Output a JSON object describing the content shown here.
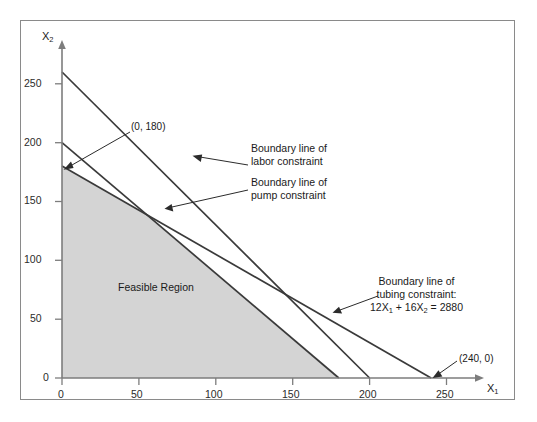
{
  "chart_data": {
    "type": "line",
    "title": "",
    "xlabel": "X1",
    "ylabel": "X2",
    "xlim": [
      0,
      270
    ],
    "ylim": [
      0,
      275
    ],
    "grid": false,
    "legend": "none",
    "xticks": [
      0,
      50,
      100,
      150,
      200,
      250
    ],
    "yticks": [
      0,
      50,
      100,
      150,
      200,
      250
    ],
    "xtick_labels": [
      "0",
      "50",
      "100",
      "150",
      "200",
      "250"
    ],
    "ytick_labels": [
      "0",
      "50",
      "100",
      "150",
      "200",
      "250"
    ],
    "series": [
      {
        "name": "Boundary line of tubing constraint",
        "equation": "12X1 + 16X2 = 2880",
        "x": [
          0,
          240
        ],
        "y": [
          180,
          0
        ],
        "intercepts": {
          "x": 240,
          "y": 180
        }
      },
      {
        "name": "Boundary line of labor constraint",
        "x": [
          0,
          200
        ],
        "y": [
          260,
          0
        ],
        "intercepts": {
          "x": 200,
          "y": 260
        }
      },
      {
        "name": "Boundary line of pump constraint",
        "x": [
          0,
          180
        ],
        "y": [
          200,
          0
        ],
        "intercepts": {
          "x": 180,
          "y": 200
        }
      }
    ],
    "shaded_region": {
      "name": "Feasible Region",
      "fill": "#d4d4d4",
      "vertices": [
        [
          0,
          0
        ],
        [
          0,
          180
        ],
        [
          122,
          88
        ],
        [
          174,
          12
        ],
        [
          180,
          0
        ]
      ]
    },
    "annotations": [
      {
        "text": "(0, 180)",
        "x": 0,
        "y": 180
      },
      {
        "text": "(240, 0)",
        "x": 240,
        "y": 0
      },
      {
        "text": "Feasible Region",
        "x": 60,
        "y": 68
      }
    ]
  },
  "axes": {
    "x_label": "X",
    "x_label_sub": "1",
    "y_label": "X",
    "y_label_sub": "2",
    "x_ticks": [
      "0",
      "50",
      "100",
      "150",
      "200",
      "250"
    ],
    "y_ticks": [
      "0",
      "50",
      "100",
      "150",
      "200",
      "250"
    ]
  },
  "labels": {
    "point_0_180": "(0, 180)",
    "point_240_0": "(240, 0)",
    "feasible_region": "Feasible Region",
    "labor_line_1": "Boundary line of",
    "labor_line_2": "labor constraint",
    "pump_line_1": "Boundary line of",
    "pump_line_2": "pump constraint",
    "tubing_line_1": "Boundary line of",
    "tubing_line_2": "tubing constraint:",
    "tubing_eq_a": "12X",
    "tubing_eq_a_sub": "1",
    "tubing_eq_b": " + 16X",
    "tubing_eq_b_sub": "2",
    "tubing_eq_c": " = 2880"
  },
  "colors": {
    "frame": "#8a8a8a",
    "axis": "#7d7d7d",
    "line": "#3a3a3a",
    "region_fill": "#d4d4d4",
    "text": "#1a1a1a",
    "background": "#ffffff"
  }
}
